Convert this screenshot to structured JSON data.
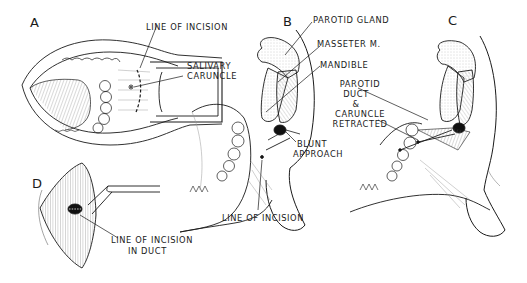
{
  "figure": {
    "panels": [
      {
        "id": "A",
        "letter": "A",
        "labels": [
          "LINE OF INCISION",
          "SALIVARY",
          "CARUNCLE"
        ]
      },
      {
        "id": "B",
        "letter": "B",
        "labels": [
          "PAROTID GLAND",
          "MASSETER M.",
          "MANDIBLE",
          "BLUNT",
          "APPROACH",
          "LINE OF INCISION"
        ]
      },
      {
        "id": "C",
        "letter": "C",
        "labels": [
          "PAROTID",
          "DUCT",
          "&",
          "CARUNCLE",
          "RETRACTED"
        ]
      },
      {
        "id": "D",
        "letter": "D",
        "labels": [
          "LINE OF INCISION",
          "IN DUCT"
        ]
      }
    ]
  },
  "colors": {
    "ink": "#1a1a1a",
    "background": "#ffffff",
    "stipple": "#9a9a9a"
  }
}
